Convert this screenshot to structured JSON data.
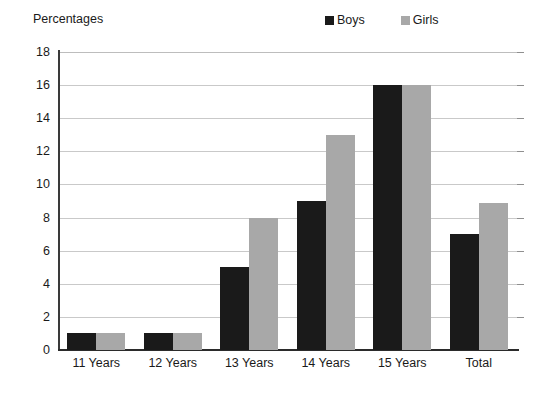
{
  "chart_data": {
    "type": "bar",
    "title": "",
    "ylabel": "Percentages",
    "xlabel": "",
    "categories": [
      "11 Years",
      "12 Years",
      "13 Years",
      "14 Years",
      "15 Years",
      "Total"
    ],
    "series": [
      {
        "name": "Boys",
        "color": "#1a1a1a",
        "values": [
          1,
          1,
          5,
          9,
          16,
          7
        ]
      },
      {
        "name": "Girls",
        "color": "#a8a8a8",
        "values": [
          1,
          1,
          8,
          13,
          16,
          8.9
        ]
      }
    ],
    "ylim": [
      0,
      18
    ],
    "ytick_step": 2,
    "yticks": [
      0,
      2,
      4,
      6,
      8,
      10,
      12,
      14,
      16,
      18
    ],
    "ytick_labels": [
      "0",
      "2",
      "4",
      "6",
      "8",
      "10",
      "12",
      "14",
      "16",
      "18"
    ],
    "grid": "horizontal",
    "legend_position": "top-right",
    "background": "#ffffff",
    "gridline_color": "#c9c9c9",
    "axis_color": "#2b2b2b"
  }
}
